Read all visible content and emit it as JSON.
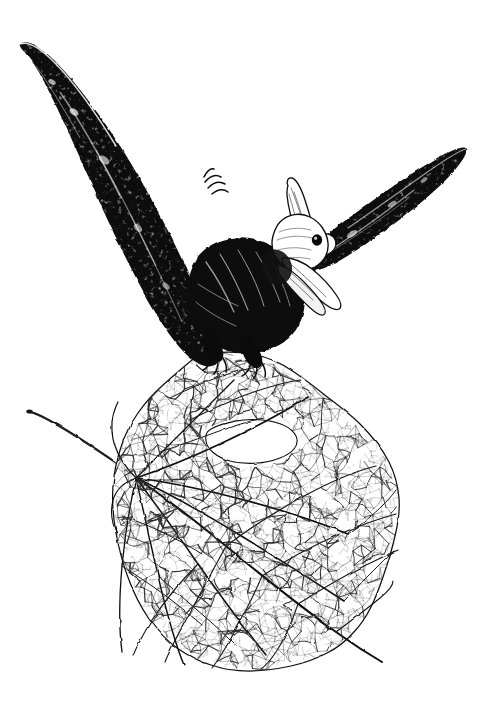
{
  "artwork": {
    "title": "Pterosaur Perched on a Skeletonized Leaf",
    "medium": "Pen and ink illustration",
    "caption": "A black ink drawing of a pterosaur with outstretched wings perched on the tip of a skeleton leaf",
    "canvas": {
      "width": 479,
      "height": 724
    },
    "background_color": "#ffffff",
    "ink_color": "#000000",
    "vein_color": "#1a1a1a"
  },
  "subjects": {
    "creature": {
      "name": "pterosaur",
      "label": "Pterosaur",
      "parts": [
        {
          "id": "left-wing",
          "label": "Left wing",
          "tone": "solid-black"
        },
        {
          "id": "right-wing",
          "label": "Right wing",
          "tone": "solid-black"
        },
        {
          "id": "body",
          "label": "Body and torso",
          "tone": "dense-hatching"
        },
        {
          "id": "head",
          "label": "Head with backswept crest",
          "tone": "light-outline"
        },
        {
          "id": "beak",
          "label": "Long pointed beak",
          "tone": "light-outline"
        },
        {
          "id": "eye",
          "label": "Eye",
          "tone": "solid-black"
        },
        {
          "id": "feet",
          "label": "Clawed feet gripping leaf",
          "tone": "solid-black"
        },
        {
          "id": "wing-claw",
          "label": "Wing finger claws",
          "tone": "solid-black"
        }
      ]
    },
    "leaf": {
      "name": "skeleton-leaf",
      "label": "Skeletonized leaf",
      "parts": [
        {
          "id": "petiole",
          "label": "Leaf stem (petiole)"
        },
        {
          "id": "vein-node",
          "label": "Vein junction node"
        },
        {
          "id": "midrib",
          "label": "Midrib"
        },
        {
          "id": "vein-network",
          "label": "Reticulated vein network"
        },
        {
          "id": "leaf-hole",
          "label": "Hole in leaf blade"
        },
        {
          "id": "leaf-margin",
          "label": "Ragged leaf margin"
        }
      ]
    }
  }
}
